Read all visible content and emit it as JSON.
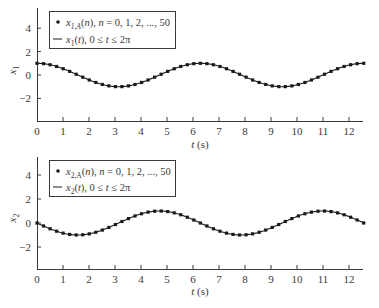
{
  "chart_data": [
    {
      "type": "line",
      "title": "",
      "xlabel": "t (s)",
      "ylabel": "x1",
      "xlim": [
        0,
        12.566
      ],
      "ylim": [
        -3.9,
        5.7
      ],
      "x_ticks": [
        0,
        1,
        2,
        3,
        4,
        5,
        6,
        7,
        8,
        9,
        10,
        11,
        12
      ],
      "y_ticks": [
        4,
        2,
        0,
        -2
      ],
      "grid": false,
      "legend_position": "upper-left",
      "legend": [
        {
          "marker": "dot",
          "label_main": "x",
          "label_sub": "1,A",
          "label_rest": "(n), n = 0, 1, 2, ..., 50"
        },
        {
          "marker": "line",
          "label_main": "x",
          "label_sub": "1",
          "label_rest": "(t), 0 ≤ t ≤ 2π"
        }
      ],
      "series": [
        {
          "name": "x1,A(n), n = 0, 1, 2, ..., 50",
          "style": "markers",
          "function": "cos(t)",
          "n_points": 51,
          "t_start": 0,
          "t_end": 12.566
        },
        {
          "name": "x1(t), 0 ≤ t ≤ 2π",
          "style": "solid-line",
          "function": "cos(t)",
          "t_start": 0,
          "t_end": 12.566
        }
      ],
      "key_values": {
        "x_at_0": 1,
        "min": -1,
        "min_at_t": [
          3.14,
          9.42
        ],
        "max_at_t": [
          0,
          6.28,
          12.57
        ]
      }
    },
    {
      "type": "line",
      "title": "",
      "xlabel": "t (s)",
      "ylabel": "x2",
      "xlim": [
        0,
        12.566
      ],
      "ylim": [
        -3.8,
        5.5
      ],
      "x_ticks": [
        0,
        1,
        2,
        3,
        4,
        5,
        6,
        7,
        8,
        9,
        10,
        11,
        12
      ],
      "y_ticks": [
        4,
        2,
        0,
        -2
      ],
      "grid": false,
      "legend_position": "upper-left",
      "legend": [
        {
          "marker": "dot",
          "label_main": "x",
          "label_sub": "2,A",
          "label_rest": "(n), n = 0, 1, 2, ..., 50"
        },
        {
          "marker": "line",
          "label_main": "x",
          "label_sub": "2",
          "label_rest": "(t), 0 ≤ t ≤ 2π"
        }
      ],
      "series": [
        {
          "name": "x2,A(n), n = 0, 1, 2, ..., 50",
          "style": "markers",
          "function": "-sin(t)",
          "n_points": 51,
          "t_start": 0,
          "t_end": 12.566
        },
        {
          "name": "x2(t), 0 ≤ t ≤ 2π",
          "style": "solid-line",
          "function": "-sin(t)",
          "t_start": 0,
          "t_end": 12.566
        }
      ],
      "key_values": {
        "x_at_0": 0,
        "min": -1,
        "min_at_t": [
          1.57,
          7.85
        ],
        "max": 1,
        "max_at_t": [
          4.71,
          10.99
        ]
      }
    }
  ],
  "plots": [
    {
      "ylabel_main": "x",
      "ylabel_sub": "1",
      "xlabel_main": "t",
      "xlabel_rest": " (s)",
      "legend": {
        "row1": {
          "main": "x",
          "sub": "1,A",
          "open": "(",
          "n": "n",
          "rest": "), ",
          "n2": "n",
          "eq": " = 0, 1, 2, ..., 50"
        },
        "row2": {
          "main": "x",
          "sub": "1",
          "open": "(",
          "t": "t",
          "rest": "), 0 ≤ ",
          "t2": "t",
          "end": " ≤ 2π"
        }
      }
    },
    {
      "ylabel_main": "x",
      "ylabel_sub": "2",
      "xlabel_main": "t",
      "xlabel_rest": " (s)",
      "legend": {
        "row1": {
          "main": "x",
          "sub": "2,A",
          "open": "(",
          "n": "n",
          "rest": "), ",
          "n2": "n",
          "eq": " = 0, 1, 2, ..., 50"
        },
        "row2": {
          "main": "x",
          "sub": "2",
          "open": "(",
          "t": "t",
          "rest": "), 0 ≤ ",
          "t2": "t",
          "end": " ≤ 2π"
        }
      }
    }
  ],
  "colors": {
    "ink": "#3a3a3a",
    "series": "#1a1a1a",
    "background": "#ffffff"
  }
}
